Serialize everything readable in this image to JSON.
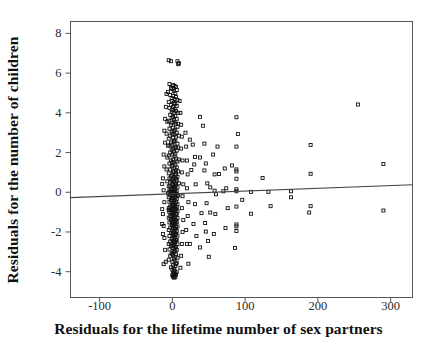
{
  "chart_data": {
    "type": "scatter",
    "title": "",
    "xlabel": "Residuals for the lifetime number of sex partners",
    "ylabel": "Residuals for the number of children",
    "xlim": [
      -140,
      330
    ],
    "ylim": [
      -5.3,
      8.6
    ],
    "xticks": [
      -100,
      0,
      100,
      200,
      300
    ],
    "xticklabels": [
      "-100",
      "0",
      "100",
      "200",
      "300"
    ],
    "yticks": [
      8,
      6,
      4,
      2,
      0,
      -2,
      -4
    ],
    "yticklabels": [
      "8",
      "6",
      "4",
      "2",
      "0",
      "-2",
      "-4"
    ],
    "grid": false,
    "legend": null,
    "marker": "open-square",
    "marker_color": "#111111",
    "marker_size_px": 3,
    "frame_color": "#555555",
    "background": "#ffffff",
    "trendline": {
      "type": "linear-regression",
      "color": "#444444",
      "x_start": -140,
      "y_start": -0.27,
      "x_end": 330,
      "y_end": 0.38,
      "slope": 0.00138,
      "intercept": -0.077
    },
    "points": [
      [
        -5,
        6.65
      ],
      [
        -2,
        6.6
      ],
      [
        7,
        6.6
      ],
      [
        9,
        6.5
      ],
      [
        8,
        6.45
      ],
      [
        -4,
        5.45
      ],
      [
        1,
        5.4
      ],
      [
        3,
        5.35
      ],
      [
        5,
        5.3
      ],
      [
        -2,
        5.25
      ],
      [
        0,
        5.2
      ],
      [
        6,
        5.15
      ],
      [
        2,
        5.1
      ],
      [
        -6,
        5.05
      ],
      [
        4,
        5.0
      ],
      [
        -3,
        4.9
      ],
      [
        1,
        4.85
      ],
      [
        5,
        4.8
      ],
      [
        -1,
        4.75
      ],
      [
        3,
        4.7
      ],
      [
        7,
        4.65
      ],
      [
        0,
        4.6
      ],
      [
        -5,
        4.55
      ],
      [
        2,
        4.5
      ],
      [
        4,
        4.45
      ],
      [
        -2,
        4.4
      ],
      [
        6,
        4.35
      ],
      [
        1,
        4.3
      ],
      [
        -4,
        4.25
      ],
      [
        3,
        4.2
      ],
      [
        0,
        4.15
      ],
      [
        5,
        4.1
      ],
      [
        -1,
        4.05
      ],
      [
        2,
        4.0
      ],
      [
        8,
        4.0
      ],
      [
        255,
        4.42
      ],
      [
        -3,
        3.9
      ],
      [
        4,
        3.85
      ],
      [
        1,
        3.8
      ],
      [
        38,
        3.8
      ],
      [
        88,
        3.78
      ],
      [
        -1,
        3.75
      ],
      [
        6,
        3.7
      ],
      [
        2,
        3.65
      ],
      [
        -5,
        3.6
      ],
      [
        3,
        3.55
      ],
      [
        0,
        3.5
      ],
      [
        5,
        3.45
      ],
      [
        -2,
        3.4
      ],
      [
        42,
        3.35
      ],
      [
        7,
        3.3
      ],
      [
        1,
        3.25
      ],
      [
        -4,
        3.2
      ],
      [
        4,
        3.15
      ],
      [
        2,
        3.1
      ],
      [
        -1,
        3.05
      ],
      [
        6,
        3.0
      ],
      [
        90,
        2.93
      ],
      [
        0,
        2.95
      ],
      [
        3,
        2.9
      ],
      [
        -3,
        2.85
      ],
      [
        5,
        2.8
      ],
      [
        1,
        2.75
      ],
      [
        -5,
        2.7
      ],
      [
        24,
        2.65
      ],
      [
        4,
        2.6
      ],
      [
        2,
        2.55
      ],
      [
        -2,
        2.5
      ],
      [
        7,
        2.45
      ],
      [
        0,
        2.4
      ],
      [
        -4,
        2.35
      ],
      [
        3,
        2.3
      ],
      [
        62,
        2.3
      ],
      [
        88,
        2.3
      ],
      [
        190,
        2.38
      ],
      [
        5,
        2.25
      ],
      [
        1,
        2.2
      ],
      [
        -1,
        2.15
      ],
      [
        6,
        2.1
      ],
      [
        2,
        2.05
      ],
      [
        -3,
        2.0
      ],
      [
        4,
        1.95
      ],
      [
        0,
        1.9
      ],
      [
        -5,
        1.85
      ],
      [
        3,
        1.8
      ],
      [
        31,
        1.78
      ],
      [
        38,
        1.75
      ],
      [
        5,
        1.7
      ],
      [
        1,
        1.65
      ],
      [
        -2,
        1.6
      ],
      [
        7,
        1.55
      ],
      [
        2,
        1.5
      ],
      [
        -4,
        1.45
      ],
      [
        4,
        1.4
      ],
      [
        290,
        1.42
      ],
      [
        0,
        1.35
      ],
      [
        -1,
        1.3
      ],
      [
        6,
        1.25
      ],
      [
        3,
        1.2
      ],
      [
        -3,
        1.15
      ],
      [
        5,
        1.1
      ],
      [
        26,
        1.12
      ],
      [
        44,
        1.1
      ],
      [
        64,
        0.92
      ],
      [
        82,
        1.35
      ],
      [
        88,
        1.15
      ],
      [
        88,
        1.05
      ],
      [
        1,
        1.05
      ],
      [
        2,
        1.0
      ],
      [
        -5,
        0.95
      ],
      [
        4,
        0.9
      ],
      [
        190,
        0.93
      ],
      [
        0,
        0.85
      ],
      [
        -2,
        0.8
      ],
      [
        7,
        0.78
      ],
      [
        3,
        0.75
      ],
      [
        -4,
        0.7
      ],
      [
        5,
        0.68
      ],
      [
        1,
        0.65
      ],
      [
        88,
        0.68
      ],
      [
        124,
        0.72
      ],
      [
        -1,
        0.6
      ],
      [
        6,
        0.58
      ],
      [
        2,
        0.55
      ],
      [
        -3,
        0.5
      ],
      [
        4,
        0.45
      ],
      [
        -14,
        0.42
      ],
      [
        0,
        0.4
      ],
      [
        5,
        0.38
      ],
      [
        1,
        0.35
      ],
      [
        -5,
        0.3
      ],
      [
        3,
        0.28
      ],
      [
        7,
        0.25
      ],
      [
        2,
        0.2
      ],
      [
        -2,
        0.18
      ],
      [
        4,
        0.15
      ],
      [
        0,
        0.12
      ],
      [
        -4,
        0.08
      ],
      [
        6,
        0.05
      ],
      [
        1,
        0.02
      ],
      [
        52,
        0.25
      ],
      [
        58,
        0.08
      ],
      [
        70,
        0.05
      ],
      [
        88,
        0.15
      ],
      [
        88,
        0.05
      ],
      [
        108,
        0.02
      ],
      [
        132,
        0.02
      ],
      [
        163,
        0.05
      ],
      [
        3,
        -0.02
      ],
      [
        -1,
        -0.05
      ],
      [
        5,
        -0.08
      ],
      [
        2,
        -0.12
      ],
      [
        -3,
        -0.15
      ],
      [
        7,
        -0.18
      ],
      [
        0,
        -0.2
      ],
      [
        -5,
        -0.25
      ],
      [
        4,
        -0.28
      ],
      [
        1,
        -0.3
      ],
      [
        163,
        -0.25
      ],
      [
        6,
        -0.35
      ],
      [
        3,
        -0.38
      ],
      [
        -2,
        -0.4
      ],
      [
        2,
        -0.45
      ],
      [
        -4,
        -0.48
      ],
      [
        5,
        -0.5
      ],
      [
        0,
        -0.55
      ],
      [
        96,
        -0.38
      ],
      [
        7,
        -0.6
      ],
      [
        1,
        -0.62
      ],
      [
        -1,
        -0.65
      ],
      [
        4,
        -0.68
      ],
      [
        3,
        -0.7
      ],
      [
        -3,
        -0.72
      ],
      [
        6,
        -0.75
      ],
      [
        2,
        -0.78
      ],
      [
        -5,
        -0.8
      ],
      [
        0,
        -0.82
      ],
      [
        5,
        -0.85
      ],
      [
        88,
        -0.72
      ],
      [
        135,
        -0.7
      ],
      [
        190,
        -0.7
      ],
      [
        290,
        -0.92
      ],
      [
        1,
        -0.88
      ],
      [
        -2,
        -0.9
      ],
      [
        4,
        -0.92
      ],
      [
        -14,
        -0.85
      ],
      [
        7,
        -0.95
      ],
      [
        3,
        -0.98
      ],
      [
        -4,
        -1.0
      ],
      [
        2,
        -1.02
      ],
      [
        0,
        -1.05
      ],
      [
        6,
        -1.08
      ],
      [
        -1,
        -1.1
      ],
      [
        5,
        -1.12
      ],
      [
        1,
        -1.15
      ],
      [
        40,
        -1.05
      ],
      [
        52,
        -1.02
      ],
      [
        108,
        -1.08
      ],
      [
        188,
        -1.02
      ],
      [
        -3,
        -1.2
      ],
      [
        4,
        -1.22
      ],
      [
        3,
        -1.25
      ],
      [
        -5,
        -1.28
      ],
      [
        7,
        -1.3
      ],
      [
        2,
        -1.32
      ],
      [
        0,
        -1.35
      ],
      [
        -2,
        -1.4
      ],
      [
        5,
        -1.42
      ],
      [
        1,
        -1.45
      ],
      [
        6,
        -1.5
      ],
      [
        -4,
        -1.52
      ],
      [
        4,
        -1.55
      ],
      [
        3,
        -1.6
      ],
      [
        -1,
        -1.62
      ],
      [
        2,
        -1.65
      ],
      [
        0,
        -1.7
      ],
      [
        -14,
        -1.6
      ],
      [
        7,
        -1.72
      ],
      [
        5,
        -1.75
      ],
      [
        -3,
        -1.78
      ],
      [
        1,
        -1.8
      ],
      [
        4,
        -1.85
      ],
      [
        88,
        -1.62
      ],
      [
        88,
        -1.72
      ],
      [
        88,
        -1.95
      ],
      [
        -5,
        -1.9
      ],
      [
        2,
        -1.92
      ],
      [
        6,
        -1.95
      ],
      [
        3,
        -2.0
      ],
      [
        0,
        -2.02
      ],
      [
        -2,
        -2.05
      ],
      [
        5,
        -2.08
      ],
      [
        1,
        -2.1
      ],
      [
        -13,
        -2.1
      ],
      [
        4,
        -2.15
      ],
      [
        7,
        -2.18
      ],
      [
        -4,
        -2.2
      ],
      [
        2,
        -2.22
      ],
      [
        46,
        -1.98
      ],
      [
        3,
        -2.3
      ],
      [
        0,
        -2.32
      ],
      [
        -1,
        -2.35
      ],
      [
        6,
        -2.4
      ],
      [
        5,
        -2.42
      ],
      [
        1,
        -2.45
      ],
      [
        -3,
        -2.48
      ],
      [
        24,
        -2.6
      ],
      [
        4,
        -2.5
      ],
      [
        2,
        -2.55
      ],
      [
        -5,
        -2.6
      ],
      [
        7,
        -2.62
      ],
      [
        3,
        -2.65
      ],
      [
        0,
        -2.7
      ],
      [
        -2,
        -2.72
      ],
      [
        5,
        -2.75
      ],
      [
        38,
        -2.78
      ],
      [
        86,
        -2.8
      ],
      [
        1,
        -2.8
      ],
      [
        4,
        -2.85
      ],
      [
        -4,
        -2.88
      ],
      [
        6,
        -2.9
      ],
      [
        2,
        -2.95
      ],
      [
        3,
        -3.0
      ],
      [
        0,
        -3.05
      ],
      [
        -1,
        -3.1
      ],
      [
        5,
        -3.12
      ],
      [
        1,
        -3.15
      ],
      [
        -3,
        -3.2
      ],
      [
        50,
        -3.25
      ],
      [
        4,
        -3.25
      ],
      [
        7,
        -3.3
      ],
      [
        2,
        -3.35
      ],
      [
        -5,
        -3.4
      ],
      [
        3,
        -3.45
      ],
      [
        0,
        -3.5
      ],
      [
        6,
        -3.55
      ],
      [
        -12,
        -3.62
      ],
      [
        22,
        -3.6
      ],
      [
        5,
        -3.62
      ],
      [
        1,
        -3.68
      ],
      [
        4,
        -3.72
      ],
      [
        -2,
        -3.78
      ],
      [
        2,
        -3.85
      ],
      [
        0,
        -3.9
      ],
      [
        3,
        -3.95
      ],
      [
        6,
        -4.0
      ],
      [
        1,
        -4.05
      ],
      [
        4,
        -4.08
      ],
      [
        2,
        -4.12
      ],
      [
        5,
        -4.15
      ],
      [
        0,
        -4.18
      ],
      [
        3,
        -4.2
      ],
      [
        1,
        -4.25
      ],
      [
        4,
        -4.28
      ],
      [
        2,
        -4.3
      ],
      [
        -8,
        4.95
      ],
      [
        -9,
        4.3
      ],
      [
        -10,
        3.7
      ],
      [
        -11,
        3.1
      ],
      [
        -10,
        2.5
      ],
      [
        -12,
        1.9
      ],
      [
        -11,
        1.3
      ],
      [
        -13,
        0.7
      ],
      [
        -12,
        0.1
      ],
      [
        -11,
        -0.5
      ],
      [
        -13,
        -1.1
      ],
      [
        -12,
        -1.7
      ],
      [
        -11,
        -2.3
      ],
      [
        -10,
        -2.9
      ],
      [
        -9,
        -3.5
      ],
      [
        10,
        4.6
      ],
      [
        11,
        4.0
      ],
      [
        12,
        3.4
      ],
      [
        13,
        2.8
      ],
      [
        12,
        2.2
      ],
      [
        14,
        1.6
      ],
      [
        13,
        1.0
      ],
      [
        15,
        0.4
      ],
      [
        14,
        -0.2
      ],
      [
        13,
        -0.8
      ],
      [
        15,
        -1.4
      ],
      [
        14,
        -2.0
      ],
      [
        13,
        -2.6
      ],
      [
        12,
        -3.2
      ],
      [
        11,
        -3.8
      ],
      [
        18,
        3.0
      ],
      [
        19,
        2.3
      ],
      [
        20,
        1.6
      ],
      [
        21,
        0.9
      ],
      [
        20,
        0.2
      ],
      [
        22,
        -0.5
      ],
      [
        21,
        -1.2
      ],
      [
        19,
        -1.9
      ],
      [
        20,
        -2.6
      ],
      [
        28,
        2.4
      ],
      [
        30,
        1.4
      ],
      [
        32,
        0.4
      ],
      [
        31,
        -0.6
      ],
      [
        29,
        -1.6
      ],
      [
        33,
        -2.2
      ],
      [
        44,
        2.45
      ],
      [
        46,
        1.45
      ],
      [
        48,
        0.45
      ],
      [
        47,
        -0.55
      ],
      [
        45,
        -1.55
      ],
      [
        49,
        -2.45
      ],
      [
        56,
        1.9
      ],
      [
        58,
        0.9
      ],
      [
        60,
        -0.1
      ],
      [
        59,
        -1.1
      ],
      [
        57,
        -2.1
      ],
      [
        72,
        1.2
      ],
      [
        74,
        0.2
      ],
      [
        76,
        -0.8
      ],
      [
        73,
        -1.8
      ],
      [
        -6,
        -0.05
      ],
      [
        -7,
        0.55
      ],
      [
        -8,
        1.15
      ],
      [
        -7,
        1.75
      ],
      [
        -6,
        2.35
      ],
      [
        -8,
        2.95
      ],
      [
        -7,
        3.55
      ],
      [
        8,
        -0.15
      ],
      [
        9,
        0.45
      ],
      [
        8,
        1.05
      ],
      [
        9,
        1.65
      ],
      [
        8,
        2.25
      ],
      [
        9,
        2.85
      ],
      [
        8,
        3.45
      ],
      [
        -2,
        0.0
      ],
      [
        0,
        0.0
      ],
      [
        2,
        0.0
      ],
      [
        -4,
        0.0
      ],
      [
        4,
        0.0
      ],
      [
        -1,
        -0.3
      ],
      [
        1,
        -0.3
      ],
      [
        3,
        0.3
      ],
      [
        -3,
        0.3
      ],
      [
        0,
        1.5
      ],
      [
        0,
        -1.5
      ],
      [
        2,
        2.6
      ],
      [
        -2,
        -2.6
      ],
      [
        5,
        0.9
      ],
      [
        -5,
        -0.9
      ]
    ]
  }
}
